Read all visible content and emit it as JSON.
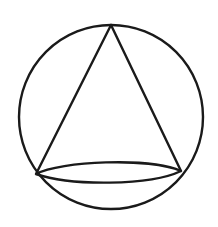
{
  "diagram": {
    "stroke_color": "#1a1a1a",
    "background": "#ffffff",
    "circle": {
      "cx": 111,
      "cy": 117,
      "r": 92
    },
    "cone": {
      "apex": {
        "x": 111,
        "y": 25
      },
      "base_left": {
        "x": 36,
        "y": 174
      },
      "base_right": {
        "x": 181,
        "y": 171
      },
      "base_ellipse": {
        "cx": 108.5,
        "cy": 172,
        "rx": 72.5,
        "ry": 11.5
      }
    }
  }
}
